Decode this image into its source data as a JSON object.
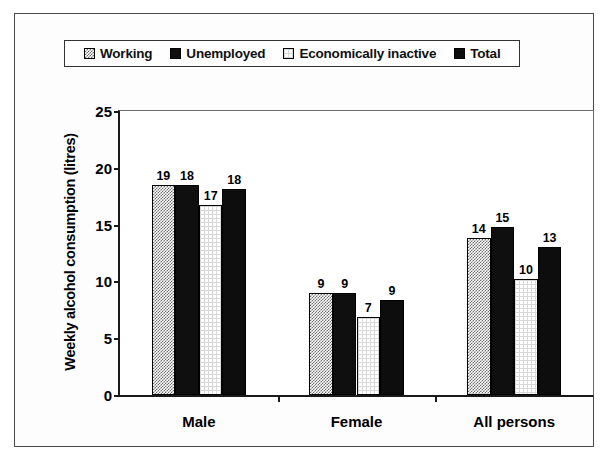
{
  "chart_data": {
    "type": "bar",
    "title": "",
    "xlabel": "",
    "ylabel": "Weekly alcohol consumption (litres)",
    "categories": [
      "Male",
      "Female",
      "All persons"
    ],
    "ylim": [
      0,
      25
    ],
    "yticks": [
      0,
      5,
      10,
      15,
      20,
      25
    ],
    "ytick_labels": [
      "0",
      "5",
      "10",
      "15",
      "20",
      "25"
    ],
    "grid": false,
    "legend_position": "top",
    "series": [
      {
        "name": "Working",
        "swatch": "gray-checker",
        "values": [
          18.5,
          9.0,
          13.8
        ],
        "labels": [
          "19",
          "9",
          "14"
        ]
      },
      {
        "name": "Unemployed",
        "swatch": "black-solid",
        "values": [
          18.5,
          9.0,
          14.8
        ],
        "labels": [
          "18",
          "9",
          "15"
        ]
      },
      {
        "name": "Economically inactive",
        "swatch": "white-open",
        "values": [
          16.7,
          6.9,
          10.2
        ],
        "labels": [
          "17",
          "7",
          "10"
        ]
      },
      {
        "name": "Total",
        "swatch": "black-solid",
        "values": [
          18.1,
          8.4,
          13.0
        ],
        "labels": [
          "18",
          "9",
          "13"
        ]
      }
    ]
  },
  "legend": {
    "items": [
      {
        "label": "Working"
      },
      {
        "label": "Unemployed"
      },
      {
        "label": "Economically inactive"
      },
      {
        "label": "Total"
      }
    ]
  }
}
